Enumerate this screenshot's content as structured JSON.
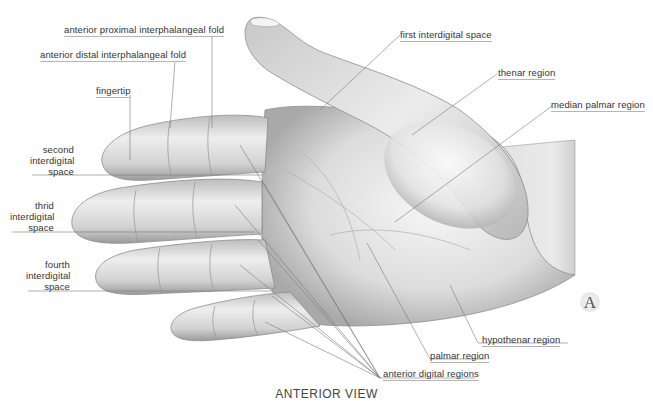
{
  "figure": {
    "caption": "ANTERIOR VIEW",
    "panel_marker": "A",
    "colors": {
      "skin_light": "#f4f4f4",
      "skin_mid": "#cfcfcf",
      "skin_dark": "#8f8f8f",
      "leader_line": "#7a7a7a",
      "label_text": "#333333"
    },
    "labels": {
      "anterior_proximal_interphalangeal_fold": "anterior proximal interphalangeal fold",
      "anterior_distal_interphalangeal_fold": "anterior distal interphalangeal fold",
      "fingertip": "fingertip",
      "second_interdigital_space": [
        "second",
        "interdigital",
        "space"
      ],
      "third_interdigital_space": [
        "thrid",
        "interdigital",
        "space"
      ],
      "fourth_interdigital_space": [
        "fourth",
        "interdigital",
        "space"
      ],
      "first_interdigital_space": "first interdigital space",
      "thenar_region": "thenar region",
      "median_palmar_region": "median palmar region",
      "hypothenar_region": "hypothenar region",
      "palmar_region": "palmar region",
      "anterior_digital_regions": "anterior digital regions"
    }
  }
}
